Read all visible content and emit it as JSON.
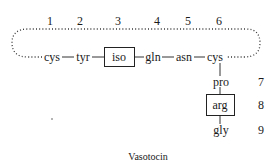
{
  "diagram": {
    "caption": "Vasotocin",
    "ring_positions": [
      "1",
      "2",
      "3",
      "4",
      "5",
      "6"
    ],
    "ring_residues": [
      "cys",
      "tyr",
      "iso",
      "gln",
      "asn",
      "cys"
    ],
    "tail_positions": [
      "7",
      "8",
      "9"
    ],
    "tail_residues": [
      "pro",
      "arg",
      "gly"
    ],
    "boxed_residues": [
      "iso",
      "arg"
    ],
    "bond_symbol": "—",
    "disulfide_link": "dotted loop connecting cys 1 and cys 6"
  }
}
